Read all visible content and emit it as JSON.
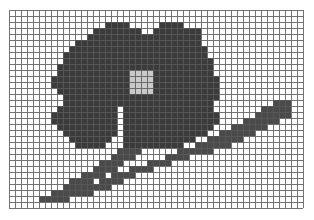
{
  "document": {
    "title": "Pixel Grid Flower Drawing",
    "description": "A pixel-art flower with four petals, a light center, a diagonal stem and a single leaf, drawn on a square graph-paper grid."
  },
  "canvas": {
    "width": 314,
    "height": 220,
    "background_color": "#ffffff"
  },
  "grid": {
    "origin_x": 9,
    "origin_y": 10,
    "cell_size": 6,
    "cols": 49,
    "rows": 33,
    "line_color": "#5a5a5a",
    "line_width": 1,
    "visible": true
  },
  "palette": {
    "petal_dark": "#3b3b3b",
    "petal_center_light": "#c9c9c9",
    "stem_gray": "#4a4a4a",
    "leaf_gray": "#4a4a4a",
    "empty_cell": "#ffffff",
    "grid_line": "#5a5a5a"
  },
  "legend": [
    {
      "name": "petal",
      "color": "#3b3b3b",
      "label": "Petal"
    },
    {
      "name": "center",
      "color": "#c9c9c9",
      "label": "Flower center"
    },
    {
      "name": "stem",
      "color": "#4a4a4a",
      "label": "Stem"
    },
    {
      "name": "leaf",
      "color": "#4a4a4a",
      "label": "Leaf"
    }
  ],
  "pixel_art": {
    "cols": 49,
    "rows": 33,
    "legend_chars": {
      ".": "empty",
      "#": "petal",
      "o": "center",
      "s": "stem",
      "l": "leaf"
    },
    "rows_data": [
      ".................................................",
      ".................................................",
      "................####.....####....................",
      "..............########..########.................",
      ".............###################.................",
      "...........#####################.................",
      "..........#######################................",
      ".........########################................",
      ".........#########################...............",
      "........##########################...............",
      "........############oooo##########...............",
      ".......#############oooo###########..............",
      ".......#############oooo###########..............",
      "........############oooo###########..............",
      ".........##########################..............",
      ".........#########################..........lll..",
      "........##########.###############........lllll..",
      ".......###########.################......llllll..",
      ".......###########.################....llllll....",
      "........##########.###############...llllll......",
      ".........#########.##############..llllll........",
      "..........#######..############..llllll..........",
      "...........#####...##########..llllll............",
      "..................ssss......llllll...............",
      ".................ssss.....llll...................",
      "...............ssss....ssss......................",
      "..............ssss..ssss.........................",
      "............ssss.ssss............................",
      "..........ssss.ssss..............................",
      ".........ssssssss................................",
      ".......sssssss...................................",
      ".....sssss.......................................",
      "................................................."
    ]
  }
}
